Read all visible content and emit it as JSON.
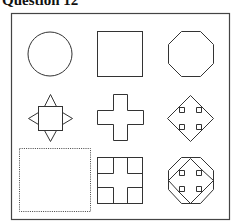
{
  "question": {
    "title": "Question 12"
  },
  "puzzle": {
    "type": "3x3 matrix reasoning",
    "stroke_color": "#333333",
    "frame_color": "#444444",
    "cells": [
      {
        "row": 1,
        "col": 1,
        "shape": "circle"
      },
      {
        "row": 1,
        "col": 2,
        "shape": "square"
      },
      {
        "row": 1,
        "col": 3,
        "shape": "octagon"
      },
      {
        "row": 2,
        "col": 1,
        "shape": "square-with-side-triangles"
      },
      {
        "row": 2,
        "col": 2,
        "shape": "plus-cross"
      },
      {
        "row": 2,
        "col": 3,
        "shape": "four-way-arrow"
      },
      {
        "row": 3,
        "col": 1,
        "shape": "missing-dotted-box"
      },
      {
        "row": 3,
        "col": 2,
        "shape": "square-with-cross-cutout"
      },
      {
        "row": 3,
        "col": 3,
        "shape": "octagon-with-four-way-arrow"
      }
    ]
  }
}
